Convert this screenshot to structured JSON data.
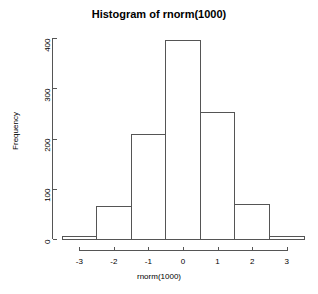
{
  "chart_data": {
    "type": "bar",
    "title": "Histogram of rnorm(1000)",
    "xlabel": "rnorm(1000)",
    "ylabel": "Frequency",
    "categories": [
      "-3.5 to -2.5",
      "-2.5 to -1.5",
      "-1.5 to -0.5",
      "-0.5 to 0.5",
      "0.5 to 1.5",
      "1.5 to 2.5",
      "2.5 to 3.5"
    ],
    "bin_edges": [
      -3.5,
      -2.5,
      -1.5,
      -0.5,
      0.5,
      1.5,
      2.5,
      3.5
    ],
    "bin_centers": [
      -3,
      -2,
      -1,
      0,
      1,
      2,
      3
    ],
    "values": [
      4,
      64,
      207,
      395,
      251,
      68,
      5
    ],
    "xlim": [
      -3.5,
      3.5
    ],
    "ylim": [
      0,
      400
    ],
    "xticks": [
      -3,
      -2,
      -1,
      0,
      1,
      2,
      3
    ],
    "xtick_labels": [
      "-3",
      "-2",
      "-1",
      "0",
      "1",
      "2",
      "3"
    ],
    "yticks": [
      0,
      100,
      200,
      300,
      400
    ],
    "ytick_labels": [
      "0",
      "100",
      "200",
      "300",
      "400"
    ],
    "grid": false,
    "legend": false,
    "bar_fill": "#ffffff",
    "bar_stroke": "#555555",
    "axis_color": "#555555",
    "text_color": "#000000",
    "background": "#ffffff"
  }
}
